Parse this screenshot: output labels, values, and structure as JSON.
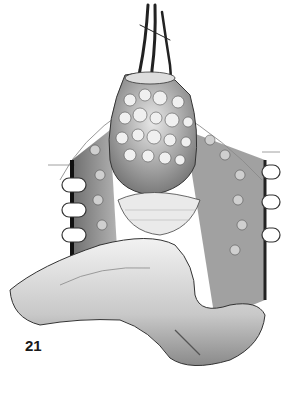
{
  "figure": {
    "number": "21",
    "palette": {
      "background": "#ffffff",
      "ink": "#1a1a1a",
      "mid_gray": "#8a8a8a",
      "light_gray": "#d0d0d0",
      "shadow": "#3a3a3a"
    }
  }
}
